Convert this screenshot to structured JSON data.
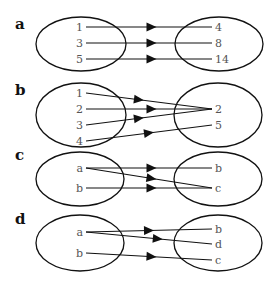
{
  "panels": [
    {
      "label": "a",
      "label_pos": [
        15,
        29
      ],
      "left_ellipse": {
        "cx": 81,
        "cy": 44,
        "rx": 45,
        "ry": 27
      },
      "right_ellipse": {
        "cx": 219,
        "cy": 44,
        "rx": 44,
        "ry": 27
      },
      "domain": [
        {
          "text": "1",
          "x": 84,
          "y": 27
        },
        {
          "text": "3",
          "x": 84,
          "y": 43
        },
        {
          "text": "5",
          "x": 84,
          "y": 59
        }
      ],
      "codomain": [
        {
          "text": "4",
          "x": 214,
          "y": 27
        },
        {
          "text": "8",
          "x": 214,
          "y": 43
        },
        {
          "text": "14",
          "x": 214,
          "y": 59
        }
      ],
      "mappings": [
        {
          "from": 0,
          "to": 0,
          "arrow_t": 0.52
        },
        {
          "from": 1,
          "to": 1,
          "arrow_t": 0.52
        },
        {
          "from": 2,
          "to": 2,
          "arrow_t": 0.52
        }
      ]
    },
    {
      "label": "b",
      "label_pos": [
        15,
        95
      ],
      "left_ellipse": {
        "cx": 81,
        "cy": 115,
        "rx": 45,
        "ry": 32
      },
      "right_ellipse": {
        "cx": 218,
        "cy": 115,
        "rx": 44,
        "ry": 32
      },
      "domain": [
        {
          "text": "1",
          "x": 84,
          "y": 93
        },
        {
          "text": "2",
          "x": 84,
          "y": 109
        },
        {
          "text": "3",
          "x": 84,
          "y": 125
        },
        {
          "text": "4",
          "x": 84,
          "y": 141
        }
      ],
      "codomain": [
        {
          "text": "2",
          "x": 214,
          "y": 109
        },
        {
          "text": "5",
          "x": 214,
          "y": 125
        }
      ],
      "mappings": [
        {
          "from": 0,
          "to": 0,
          "arrow_t": 0.42
        },
        {
          "from": 1,
          "to": 0,
          "arrow_t": 0.52
        },
        {
          "from": 2,
          "to": 0,
          "arrow_t": 0.42
        },
        {
          "from": 3,
          "to": 1,
          "arrow_t": 0.5
        }
      ]
    },
    {
      "label": "c",
      "label_pos": [
        15,
        160
      ],
      "left_ellipse": {
        "cx": 80,
        "cy": 179,
        "rx": 44,
        "ry": 27
      },
      "right_ellipse": {
        "cx": 218,
        "cy": 179,
        "rx": 44,
        "ry": 27
      },
      "domain": [
        {
          "text": "a",
          "x": 84,
          "y": 168
        },
        {
          "text": "b",
          "x": 84,
          "y": 188
        }
      ],
      "codomain": [
        {
          "text": "b",
          "x": 214,
          "y": 168
        },
        {
          "text": "c",
          "x": 214,
          "y": 188
        }
      ],
      "mappings": [
        {
          "from": 0,
          "to": 0,
          "arrow_t": 0.52
        },
        {
          "from": 0,
          "to": 1,
          "arrow_t": 0.52
        },
        {
          "from": 1,
          "to": 1,
          "arrow_t": 0.52
        }
      ]
    },
    {
      "label": "d",
      "label_pos": [
        15,
        224
      ],
      "left_ellipse": {
        "cx": 80,
        "cy": 243,
        "rx": 44,
        "ry": 28
      },
      "right_ellipse": {
        "cx": 218,
        "cy": 243,
        "rx": 44,
        "ry": 28
      },
      "domain": [
        {
          "text": "a",
          "x": 84,
          "y": 232
        },
        {
          "text": "b",
          "x": 84,
          "y": 253
        }
      ],
      "codomain": [
        {
          "text": "b",
          "x": 214,
          "y": 229
        },
        {
          "text": "d",
          "x": 214,
          "y": 244
        },
        {
          "text": "c",
          "x": 214,
          "y": 260
        }
      ],
      "mappings": [
        {
          "from": 0,
          "to": 0,
          "arrow_t": 0.5
        },
        {
          "from": 0,
          "to": 1,
          "arrow_t": 0.57
        },
        {
          "from": 1,
          "to": 2,
          "arrow_t": 0.52
        }
      ]
    }
  ],
  "colors": {
    "stroke": "#111111",
    "node_text": "#555555",
    "panel_label": "#111111"
  }
}
